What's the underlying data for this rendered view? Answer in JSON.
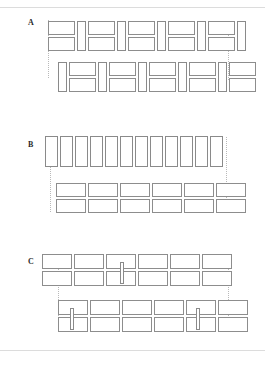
{
  "figure": {
    "title": "",
    "panels": [
      {
        "id": "A",
        "label": "A",
        "label_pos": {
          "x": 28,
          "y": 19
        },
        "description": "Two staggered courses of alternating split (stacked pair) and full-height modules",
        "guides": [
          {
            "x": 48,
            "y": 20,
            "h": 58
          },
          {
            "x": 228,
            "y": 22,
            "h": 58
          }
        ],
        "rows": [
          {
            "name": "row-1",
            "y": 21,
            "h": 30,
            "modules": [
              {
                "type": "split",
                "x": 48,
                "w": 27
              },
              {
                "type": "tall",
                "x": 77,
                "w": 9
              },
              {
                "type": "split",
                "x": 88,
                "w": 27
              },
              {
                "type": "tall",
                "x": 117,
                "w": 9
              },
              {
                "type": "split",
                "x": 128,
                "w": 27
              },
              {
                "type": "tall",
                "x": 157,
                "w": 9
              },
              {
                "type": "split",
                "x": 168,
                "w": 27
              },
              {
                "type": "tall",
                "x": 197,
                "w": 9
              },
              {
                "type": "split",
                "x": 208,
                "w": 27
              },
              {
                "type": "tall",
                "x": 237,
                "w": 9
              }
            ]
          },
          {
            "name": "row-2",
            "y": 62,
            "h": 30,
            "modules": [
              {
                "type": "tall",
                "x": 58,
                "w": 9
              },
              {
                "type": "split",
                "x": 69,
                "w": 27
              },
              {
                "type": "tall",
                "x": 98,
                "w": 9
              },
              {
                "type": "split",
                "x": 109,
                "w": 27
              },
              {
                "type": "tall",
                "x": 138,
                "w": 9
              },
              {
                "type": "split",
                "x": 149,
                "w": 27
              },
              {
                "type": "tall",
                "x": 178,
                "w": 9
              },
              {
                "type": "split",
                "x": 189,
                "w": 27
              },
              {
                "type": "tall",
                "x": 218,
                "w": 9
              },
              {
                "type": "split",
                "x": 229,
                "w": 27
              }
            ]
          }
        ]
      },
      {
        "id": "B",
        "label": "B",
        "label_pos": {
          "x": 28,
          "y": 141
        },
        "description": "Single course of full-height narrow modules above two courses of wide modules",
        "guides": [
          {
            "x": 50,
            "y": 137,
            "h": 75
          },
          {
            "x": 226,
            "y": 137,
            "h": 75
          }
        ],
        "rows": [
          {
            "name": "row-1",
            "y": 136,
            "h": 31,
            "modules": [
              {
                "type": "tall",
                "x": 45,
                "w": 13
              },
              {
                "type": "tall",
                "x": 60,
                "w": 13
              },
              {
                "type": "tall",
                "x": 75,
                "w": 13
              },
              {
                "type": "tall",
                "x": 90,
                "w": 13
              },
              {
                "type": "tall",
                "x": 105,
                "w": 13
              },
              {
                "type": "tall",
                "x": 120,
                "w": 13
              },
              {
                "type": "tall",
                "x": 135,
                "w": 13
              },
              {
                "type": "tall",
                "x": 150,
                "w": 13
              },
              {
                "type": "tall",
                "x": 165,
                "w": 13
              },
              {
                "type": "tall",
                "x": 180,
                "w": 13
              },
              {
                "type": "tall",
                "x": 195,
                "w": 13
              },
              {
                "type": "tall",
                "x": 210,
                "w": 13
              }
            ]
          },
          {
            "name": "row-2",
            "y": 183,
            "h": 14,
            "modules": [
              {
                "type": "wide",
                "x": 56,
                "w": 30
              },
              {
                "type": "wide",
                "x": 88,
                "w": 30
              },
              {
                "type": "wide",
                "x": 120,
                "w": 30
              },
              {
                "type": "wide",
                "x": 152,
                "w": 30
              },
              {
                "type": "wide",
                "x": 184,
                "w": 30
              },
              {
                "type": "wide",
                "x": 216,
                "w": 30
              }
            ]
          },
          {
            "name": "row-3",
            "y": 199,
            "h": 14,
            "modules": [
              {
                "type": "wide",
                "x": 56,
                "w": 30
              },
              {
                "type": "wide",
                "x": 88,
                "w": 30
              },
              {
                "type": "wide",
                "x": 120,
                "w": 30
              },
              {
                "type": "wide",
                "x": 152,
                "w": 30
              },
              {
                "type": "wide",
                "x": 184,
                "w": 30
              },
              {
                "type": "wide",
                "x": 216,
                "w": 30
              }
            ]
          }
        ]
      },
      {
        "id": "C",
        "label": "C",
        "label_pos": {
          "x": 28,
          "y": 258
        },
        "description": "Two offset blocks of stacked wide modules joined by vertical connector links",
        "guides": [
          {
            "x": 58,
            "y": 254,
            "h": 76
          },
          {
            "x": 228,
            "y": 254,
            "h": 76
          }
        ],
        "rows": [
          {
            "name": "row-1",
            "y": 254,
            "h": 15,
            "modules": [
              {
                "type": "wide",
                "x": 42,
                "w": 30
              },
              {
                "type": "wide",
                "x": 74,
                "w": 30
              },
              {
                "type": "wide",
                "x": 106,
                "w": 30
              },
              {
                "type": "wide",
                "x": 138,
                "w": 30
              },
              {
                "type": "wide",
                "x": 170,
                "w": 30
              },
              {
                "type": "wide",
                "x": 202,
                "w": 30
              }
            ]
          },
          {
            "name": "row-2",
            "y": 271,
            "h": 15,
            "modules": [
              {
                "type": "wide",
                "x": 42,
                "w": 30
              },
              {
                "type": "wide",
                "x": 74,
                "w": 30
              },
              {
                "type": "wide",
                "x": 106,
                "w": 30
              },
              {
                "type": "wide",
                "x": 138,
                "w": 30
              },
              {
                "type": "wide",
                "x": 170,
                "w": 30
              },
              {
                "type": "wide",
                "x": 202,
                "w": 30
              }
            ]
          },
          {
            "name": "row-3",
            "y": 300,
            "h": 15,
            "modules": [
              {
                "type": "wide",
                "x": 58,
                "w": 30
              },
              {
                "type": "wide",
                "x": 90,
                "w": 30
              },
              {
                "type": "wide",
                "x": 122,
                "w": 30
              },
              {
                "type": "wide",
                "x": 154,
                "w": 30
              },
              {
                "type": "wide",
                "x": 186,
                "w": 30
              },
              {
                "type": "wide",
                "x": 218,
                "w": 30
              }
            ]
          },
          {
            "name": "row-4",
            "y": 317,
            "h": 15,
            "modules": [
              {
                "type": "wide",
                "x": 58,
                "w": 30
              },
              {
                "type": "wide",
                "x": 90,
                "w": 30
              },
              {
                "type": "wide",
                "x": 122,
                "w": 30
              },
              {
                "type": "wide",
                "x": 154,
                "w": 30
              },
              {
                "type": "wide",
                "x": 186,
                "w": 30
              },
              {
                "type": "wide",
                "x": 218,
                "w": 30
              }
            ]
          }
        ],
        "connectors": [
          {
            "name": "connector-1",
            "x": 120,
            "y": 262,
            "w": 4,
            "h": 22
          },
          {
            "name": "connector-2",
            "x": 70,
            "y": 308,
            "w": 4,
            "h": 22
          },
          {
            "name": "connector-3",
            "x": 196,
            "y": 308,
            "w": 4,
            "h": 22
          }
        ]
      }
    ],
    "rules": [
      {
        "name": "page-rule-top",
        "y": 7
      },
      {
        "name": "page-rule-bottom",
        "y": 350
      }
    ],
    "colors": {
      "module_stroke": "#8d8d8d",
      "guide_stroke": "#b9b9b9",
      "rule_stroke": "#dcdcdc",
      "label_color": "#2b2b2b",
      "background": "#ffffff"
    }
  }
}
